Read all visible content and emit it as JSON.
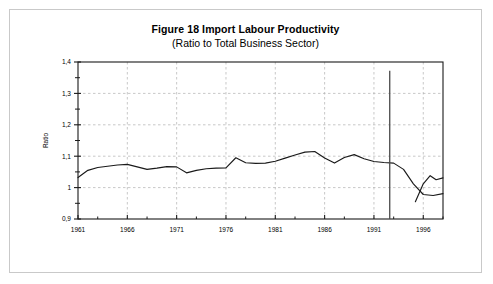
{
  "figure": {
    "title": "Figure 18  Import Labour Productivity",
    "subtitle": "(Ratio to Total Business Sector)"
  },
  "chart_data": {
    "type": "line",
    "title": "Figure 18  Import Labour Productivity",
    "subtitle": "(Ratio to Total Business Sector)",
    "xlabel": "",
    "ylabel": "Ratio",
    "xlim": [
      1961,
      1998
    ],
    "ylim": [
      0.9,
      1.4
    ],
    "ytick_labels": [
      "0,9",
      "1",
      "1,1",
      "1,2",
      "1,3",
      "1,4"
    ],
    "ytick_values": [
      0.9,
      1.0,
      1.1,
      1.2,
      1.3,
      1.4
    ],
    "xtick_labels": [
      "1961",
      "1966",
      "1971",
      "1976",
      "1981",
      "1986",
      "1991",
      "1996"
    ],
    "xtick_values": [
      1961,
      1966,
      1971,
      1976,
      1981,
      1986,
      1991,
      1996
    ],
    "minor_xtick_values": [
      1963,
      1968,
      1973,
      1978,
      1983,
      1988,
      1993,
      1998
    ],
    "minor_ytick_values": [
      0.95,
      1.05,
      1.15,
      1.25,
      1.35
    ],
    "grid": true,
    "grid_style": "dashed",
    "legend": false,
    "line_color": "#1a1a1a",
    "series": [
      {
        "name": "Import Labour Productivity",
        "x": [
          1961,
          1962,
          1963,
          1964,
          1965,
          1966,
          1967,
          1968,
          1969,
          1970,
          1971,
          1972,
          1973,
          1974,
          1975,
          1976,
          1977,
          1978,
          1979,
          1980,
          1981,
          1982,
          1983,
          1984,
          1985,
          1986,
          1987,
          1988,
          1989,
          1990,
          1991,
          1992,
          1993,
          1994,
          1995,
          1996,
          1997,
          1998
        ],
        "values": [
          1.032,
          1.055,
          1.064,
          1.068,
          1.072,
          1.074,
          1.066,
          1.058,
          1.062,
          1.067,
          1.066,
          1.047,
          1.055,
          1.06,
          1.062,
          1.063,
          1.095,
          1.079,
          1.077,
          1.078,
          1.084,
          1.094,
          1.104,
          1.113,
          1.115,
          1.094,
          1.078,
          1.096,
          1.105,
          1.092,
          1.083,
          1.08,
          1.078,
          1.058,
          1.012,
          0.978,
          0.975,
          0.981
        ]
      }
    ],
    "annotations": [
      {
        "type": "vertical-line",
        "x": 1992.6,
        "y_top": 1.372,
        "y_bottom": 0.9,
        "color": "#4a4a4a"
      }
    ],
    "forecast_segment": {
      "x": [
        1995.2,
        1996,
        1996.7,
        1997.3,
        1998
      ],
      "values": [
        0.955,
        1.012,
        1.038,
        1.025,
        1.031
      ]
    }
  }
}
